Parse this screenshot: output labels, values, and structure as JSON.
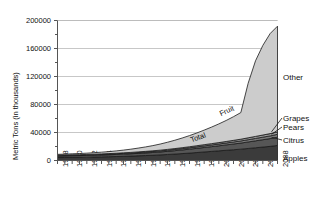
{
  "chart_data": {
    "type": "area",
    "stacked": true,
    "title": "",
    "xlabel": "",
    "ylabel": "Metric Tons (in thousands)",
    "ylim": [
      0,
      200000
    ],
    "ytick_labels": [
      "0",
      "40000",
      "80000",
      "120000",
      "160000",
      "200000"
    ],
    "ytick_values": [
      0,
      40000,
      80000,
      120000,
      160000,
      200000
    ],
    "yminor_step": 20000,
    "grid": true,
    "grid_axis": "y",
    "legend_position": "right",
    "x": [
      1978,
      1979,
      1980,
      1981,
      1982,
      1983,
      1984,
      1985,
      1986,
      1987,
      1988,
      1989,
      1990,
      1991,
      1992,
      1993,
      1994,
      1995,
      1996,
      1997,
      1998,
      1999,
      2000,
      2001,
      2002,
      2003,
      2004,
      2005,
      2006,
      2007,
      2008
    ],
    "xtick_labels": [
      "1978",
      "1980",
      "1982",
      "1984",
      "1986",
      "1988",
      "1990",
      "1992",
      "1994",
      "1996",
      "1998",
      "2000",
      "2002",
      "2004",
      "2006",
      "2008"
    ],
    "xtick_values": [
      1978,
      1980,
      1982,
      1984,
      1986,
      1988,
      1990,
      1992,
      1994,
      1996,
      1998,
      2000,
      2002,
      2004,
      2006,
      2008
    ],
    "series": [
      {
        "name": "Apples",
        "color": "#3b3b3b",
        "values": [
          4200,
          4300,
          4500,
          4600,
          4800,
          5000,
          5200,
          5400,
          5700,
          6000,
          6300,
          6700,
          7100,
          7500,
          8000,
          8600,
          9200,
          9900,
          10600,
          11400,
          12200,
          13000,
          13800,
          14600,
          15400,
          16200,
          17200,
          18200,
          19200,
          20200,
          21500
        ]
      },
      {
        "name": "Citrus",
        "color": "#565656",
        "values": [
          2200,
          2250,
          2350,
          2400,
          2500,
          2600,
          2700,
          2800,
          2950,
          3100,
          3300,
          3500,
          3700,
          3950,
          4200,
          4500,
          4850,
          5200,
          5600,
          6000,
          6400,
          6800,
          7200,
          7700,
          8200,
          8700,
          9300,
          9900,
          10500,
          11100,
          11800
        ]
      },
      {
        "name": "Pears",
        "color": "#7a7a7a",
        "values": [
          700,
          720,
          750,
          780,
          810,
          850,
          900,
          950,
          1000,
          1060,
          1130,
          1200,
          1280,
          1370,
          1460,
          1560,
          1680,
          1800,
          1930,
          2070,
          2220,
          2370,
          2520,
          2680,
          2850,
          3020,
          3220,
          3420,
          3630,
          3840,
          4100
        ]
      },
      {
        "name": "Grapes",
        "color": "#9c9c9c",
        "values": [
          500,
          520,
          540,
          560,
          590,
          620,
          660,
          700,
          740,
          790,
          850,
          910,
          980,
          1050,
          1130,
          1220,
          1320,
          1420,
          1530,
          1650,
          1780,
          1910,
          2050,
          2200,
          2360,
          2520,
          2700,
          2880,
          3070,
          3260,
          3500
        ]
      },
      {
        "name": "Other",
        "color": "#cccccc",
        "values": [
          1200,
          1300,
          1450,
          1600,
          1800,
          2100,
          2450,
          2850,
          3300,
          3900,
          4600,
          5400,
          6300,
          7400,
          8700,
          10200,
          11900,
          13800,
          15900,
          18200,
          20800,
          23600,
          26700,
          30000,
          33800,
          38000,
          78000,
          108000,
          128000,
          143000,
          151000
        ]
      }
    ],
    "annotations": [
      {
        "text": "Total",
        "x": 1997,
        "rotation": -20
      },
      {
        "text": "Fruit",
        "x": 2001,
        "rotation": -25
      }
    ]
  },
  "legend": {
    "entries": [
      {
        "label": "Other"
      },
      {
        "label": "Grapes"
      },
      {
        "label": "Pears"
      },
      {
        "label": "Citrus"
      },
      {
        "label": "Apples"
      }
    ]
  }
}
